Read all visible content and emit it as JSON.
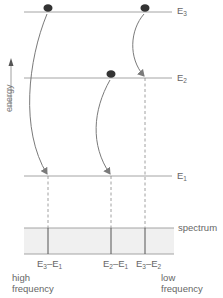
{
  "diagram": {
    "axis_label": "energy",
    "levels": [
      {
        "id": "E3",
        "base": "E",
        "sub": "3",
        "y": 12
      },
      {
        "id": "E2",
        "base": "E",
        "sub": "2",
        "y": 78
      },
      {
        "id": "E1",
        "base": "E",
        "sub": "1",
        "y": 176
      }
    ],
    "transitions": [
      {
        "from": "E3",
        "to": "E1",
        "x": 48,
        "label_a": "E",
        "sub_a": "3",
        "sep": "–",
        "label_b": "E",
        "sub_b": "1"
      },
      {
        "from": "E2",
        "to": "E1",
        "x": 111,
        "label_a": "E",
        "sub_a": "2",
        "sep": "–",
        "label_b": "E",
        "sub_b": "1"
      },
      {
        "from": "E3",
        "to": "E2",
        "x": 145,
        "label_a": "E",
        "sub_a": "3",
        "sep": "–",
        "label_b": "E",
        "sub_b": "2"
      }
    ],
    "spectrum_label": "spectrum",
    "high_label_line1": "high",
    "high_label_line2": "frequency",
    "low_label_line1": "low",
    "low_label_line2": "frequency",
    "colors": {
      "line": "#9a9a9a",
      "arrow": "#7a7a7a",
      "dot": "#333333",
      "spectrum_fill": "#f0f0f0"
    }
  }
}
